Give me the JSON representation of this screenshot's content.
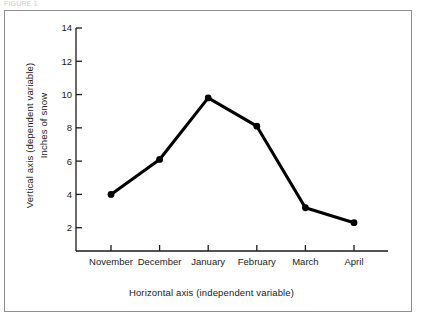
{
  "scan_caption": "FIGURE 1",
  "chart_data": {
    "type": "line",
    "title": "",
    "categories": [
      "November",
      "December",
      "January",
      "February",
      "March",
      "April"
    ],
    "values": [
      4.0,
      6.1,
      9.8,
      8.1,
      3.2,
      2.3
    ],
    "series": [
      {
        "name": "Inches of snow",
        "values": [
          4.0,
          6.1,
          9.8,
          8.1,
          3.2,
          2.3
        ]
      }
    ],
    "xlabel": "Horizontal axis  (independent variable)",
    "ylabel": "Vertical axis  (dependent variable)",
    "y_unit_label": "Inches of snow",
    "yticks": [
      2,
      4,
      6,
      8,
      10,
      12,
      14
    ],
    "ytick_labels": [
      "2",
      "4",
      "6",
      "8",
      "10",
      "12",
      "14"
    ],
    "ylim": [
      0.6,
      14.0
    ],
    "grid": false,
    "legend": "none",
    "line_color": "#000000",
    "marker": "circle",
    "marker_color": "#000000",
    "axis_color": "#1a1a1a",
    "frame_color": "#8e8e8e",
    "background": "#ffffff"
  }
}
